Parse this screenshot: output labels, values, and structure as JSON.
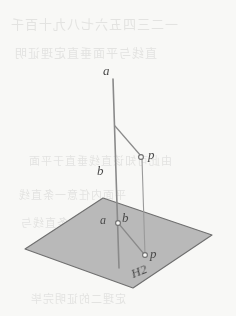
{
  "page": {
    "width": 236,
    "height": 316,
    "background_color": "#f8f8f6"
  },
  "bleed_through_text": {
    "note": "faint mirrored show-through text from reverse of scanned page, illegible",
    "lines": [
      {
        "text": "一二三四五六七八九十百千",
        "top": 14,
        "left": 10,
        "size": 13
      },
      {
        "text": "直线与平面垂直定理证明",
        "top": 44,
        "left": 14,
        "size": 12
      },
      {
        "text": "由此可知该直线垂直于平面",
        "top": 152,
        "left": 28,
        "size": 11
      },
      {
        "text": "平面内任意一条直线",
        "top": 186,
        "left": 18,
        "size": 11
      },
      {
        "text": "因此这条直线与",
        "top": 214,
        "left": 20,
        "size": 11
      },
      {
        "text": "定理二的证明完毕",
        "top": 290,
        "left": 30,
        "size": 11
      }
    ]
  },
  "figure": {
    "plane": {
      "name": "H2",
      "label": "H2",
      "fill_color": "#b9b9b9",
      "stroke_color": "#6f6f6f",
      "vertices": [
        {
          "x": 25,
          "y": 249
        },
        {
          "x": 103,
          "y": 198
        },
        {
          "x": 212,
          "y": 235
        },
        {
          "x": 133,
          "y": 288
        }
      ]
    },
    "lines": [
      {
        "name": "vertical-line-ab",
        "from": {
          "x": 113,
          "y": 79
        },
        "to": {
          "x": 119,
          "y": 268
        },
        "color": "#8a8a8a",
        "width": 1.6
      },
      {
        "name": "perpendicular-segment-p-to-ab",
        "from": {
          "x": 115,
          "y": 126
        },
        "to": {
          "x": 141,
          "y": 156
        },
        "color": "#8a8a8a",
        "width": 1.2
      },
      {
        "name": "vertical-drop-p-to-p",
        "from": {
          "x": 142,
          "y": 159
        },
        "to": {
          "x": 145,
          "y": 255
        },
        "color": "#9a9a9a",
        "width": 1.1
      },
      {
        "name": "segment-ab-to-p-in-plane",
        "from": {
          "x": 119,
          "y": 224
        },
        "to": {
          "x": 144,
          "y": 254
        },
        "color": "#8a8a8a",
        "width": 1.2
      }
    ],
    "right_angle_marker": {
      "name": "right-angle-marker",
      "at": {
        "x": 114,
        "y": 127
      },
      "size": 8,
      "color": "#8a8a8a"
    },
    "points": [
      {
        "name": "point-p-upper",
        "x": 141,
        "y": 157,
        "radius": 2.4,
        "color": "#6f6f6f"
      },
      {
        "name": "point-ab-on-plane",
        "x": 118,
        "y": 223,
        "radius": 2.4,
        "color": "#6f6f6f"
      },
      {
        "name": "point-p-on-plane",
        "x": 145,
        "y": 255,
        "radius": 2.4,
        "color": "#6f6f6f"
      }
    ],
    "labels": [
      {
        "name": "label-a-top",
        "text": "a",
        "left": 103,
        "top": 64,
        "size": 13
      },
      {
        "name": "label-b-mid",
        "text": "b",
        "left": 97,
        "top": 164,
        "size": 13
      },
      {
        "name": "label-p-upper",
        "text": "p",
        "left": 148,
        "top": 148,
        "size": 13
      },
      {
        "name": "label-a-on-plane",
        "text": "a",
        "left": 100,
        "top": 214,
        "size": 12
      },
      {
        "name": "label-b-on-plane",
        "text": "b",
        "left": 122,
        "top": 211,
        "size": 13
      },
      {
        "name": "label-p-on-plane",
        "text": "p",
        "left": 150,
        "top": 247,
        "size": 13
      },
      {
        "name": "label-plane-h2",
        "text": "H2",
        "left": 129,
        "top": 268,
        "size": 13,
        "rotate": -22
      }
    ]
  }
}
